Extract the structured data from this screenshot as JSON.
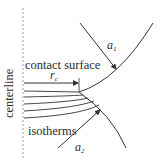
{
  "diagram": {
    "labels": {
      "centerline": "centerline",
      "contact_surface": "contact surface",
      "isotherms": "isotherms",
      "a1_base": "a",
      "a1_sub": "1",
      "a2_base": "a",
      "a2_sub": "2",
      "rc_base": "r",
      "rc_sub": "c"
    },
    "elements": {
      "centerline": "dashed vertical axis",
      "upper_body_surface": "curved boundary of body 1",
      "lower_body_surface": "curved boundary of body 2",
      "contact_radius_arrow": "r_c arrow from centerline to contact edge",
      "isotherm_count": 5
    },
    "colors": {
      "line": "#333333",
      "dashed": "#9a9a9a",
      "background": "#ffffff"
    }
  }
}
